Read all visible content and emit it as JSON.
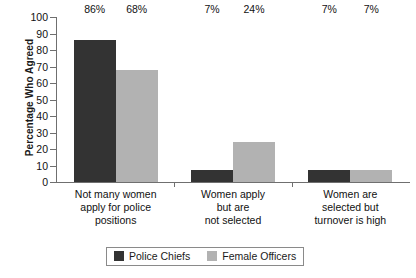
{
  "chart_data": {
    "type": "bar",
    "title": "",
    "subtitle": "",
    "xlabel": "",
    "ylabel": "Percentage Who Agreed",
    "ylim": [
      0,
      100
    ],
    "ytick_step": 10,
    "yticks": [
      100,
      90,
      80,
      70,
      60,
      50,
      40,
      30,
      20,
      10,
      0
    ],
    "grid": false,
    "legend_position": "bottom",
    "categories": [
      "Not many women apply for police positions",
      "Women apply but are not selected",
      "Women are selected but turnover is high"
    ],
    "category_lines": [
      [
        "Not many women",
        "apply for police",
        "positions"
      ],
      [
        "Women apply",
        "but are",
        "not selected"
      ],
      [
        "Women are",
        "selected but",
        "turnover is high"
      ]
    ],
    "series": [
      {
        "name": "Police Chiefs",
        "color": "#333333",
        "values": [
          86,
          7,
          7
        ],
        "labels": [
          "86%",
          "7%",
          "7%"
        ]
      },
      {
        "name": "Female Officers",
        "color": "#b2b2b2",
        "values": [
          68,
          24,
          7
        ],
        "labels": [
          "68%",
          "24%",
          "7%"
        ]
      }
    ]
  }
}
